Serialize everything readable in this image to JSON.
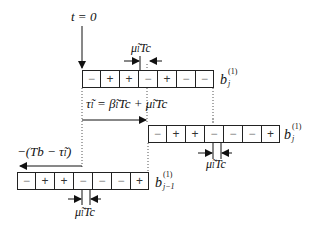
{
  "title_time_marker": "t = 0",
  "rows": [
    {
      "id": "current-bit",
      "label_main": "b",
      "label_sup": "(1)",
      "label_sub": "j",
      "cells": [
        "−",
        "+",
        "+",
        "−",
        "+",
        "−",
        "−"
      ]
    },
    {
      "id": "delayed-current-bit",
      "label_main": "b",
      "label_sup": "(1)",
      "label_sub": "j",
      "cells": [
        "−",
        "+",
        "+",
        "−",
        "−",
        "−",
        "+"
      ]
    },
    {
      "id": "previous-bit",
      "label_main": "b",
      "label_sup": "(1)",
      "label_sub": "j−1",
      "cells": [
        "−",
        "+",
        "+",
        "−",
        "−",
        "−",
        "+"
      ]
    }
  ],
  "annotations": {
    "mu_top": "μ̃ₗTc",
    "tau_equation": "τ̃ₗ = β̃ₗTc + μ̃ₗTc",
    "mu_middle": "μ̃ₗTc",
    "negative_offset": "−(Tb − τ̃ₗ)",
    "mu_bottom": "μ̃ₗTc"
  },
  "colors": {
    "line": "#222222",
    "minus_glyph": "#888888",
    "background": "#ffffff"
  }
}
